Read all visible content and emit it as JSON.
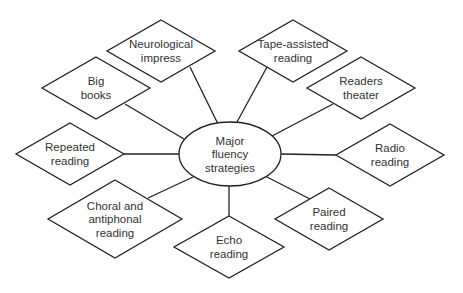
{
  "diagram": {
    "center": {
      "lines": [
        "Major",
        "fluency",
        "strategies"
      ],
      "cx": 230,
      "cy": 154,
      "rx": 51,
      "ry": 32
    },
    "nodes": [
      {
        "id": "neurological-impress",
        "lines": [
          "Neurological",
          "impress"
        ],
        "cx": 161,
        "cy": 51,
        "hw": 54,
        "hh": 31,
        "anchor": [
          190,
          67
        ]
      },
      {
        "id": "big-books",
        "lines": [
          "Big",
          "books"
        ],
        "cx": 96,
        "cy": 88,
        "hw": 54,
        "hh": 31,
        "anchor": [
          125,
          104
        ]
      },
      {
        "id": "repeated-reading",
        "lines": [
          "Repeated",
          "reading"
        ],
        "cx": 70,
        "cy": 154,
        "hw": 54,
        "hh": 31,
        "anchor": [
          124,
          154
        ]
      },
      {
        "id": "choral-antiphonal-reading",
        "lines": [
          "Choral and",
          "antiphonal",
          "reading"
        ],
        "cx": 115,
        "cy": 219,
        "hw": 67,
        "hh": 39,
        "anchor": [
          148,
          198
        ]
      },
      {
        "id": "echo-reading",
        "lines": [
          "Echo",
          "reading"
        ],
        "cx": 229,
        "cy": 247,
        "hw": 55,
        "hh": 31,
        "anchor": [
          229,
          216
        ]
      },
      {
        "id": "paired-reading",
        "lines": [
          "Paired",
          "reading"
        ],
        "cx": 329,
        "cy": 219,
        "hw": 54,
        "hh": 31,
        "anchor": [
          310,
          199
        ]
      },
      {
        "id": "radio-reading",
        "lines": [
          "Radio",
          "reading"
        ],
        "cx": 390,
        "cy": 155,
        "hw": 54,
        "hh": 31,
        "anchor": [
          336,
          155
        ]
      },
      {
        "id": "readers-theater",
        "lines": [
          "Readers",
          "theater"
        ],
        "cx": 361,
        "cy": 88,
        "hw": 54,
        "hh": 31,
        "anchor": [
          333,
          104
        ]
      },
      {
        "id": "tape-assisted-reading",
        "lines": [
          "Tape-assisted",
          "reading"
        ],
        "cx": 293,
        "cy": 51,
        "hw": 54,
        "hh": 31,
        "anchor": [
          267,
          67
        ]
      }
    ],
    "center_anchors": [
      [
        218,
        124
      ],
      [
        184,
        139
      ],
      [
        179,
        154
      ],
      [
        193,
        177
      ],
      [
        229,
        186
      ],
      [
        265,
        176
      ],
      [
        281,
        154
      ],
      [
        272,
        136
      ],
      [
        237,
        122
      ]
    ],
    "colors": {
      "stroke": "#222222",
      "text": "#333333",
      "background": "#ffffff"
    }
  }
}
